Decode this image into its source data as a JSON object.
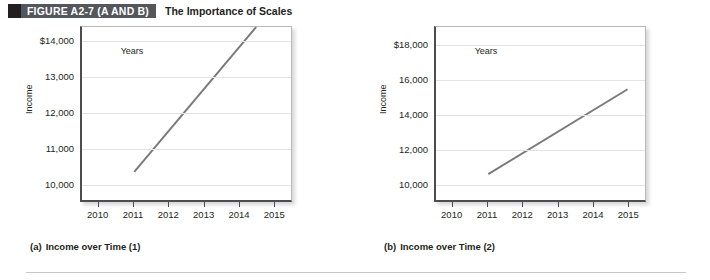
{
  "header": {
    "figure_tag": "FIGURE A2-7 (A AND B)",
    "title": "The Importance of Scales",
    "tag_bg": "#53565a",
    "tag_swatch": "#231f20"
  },
  "chart_data": [
    {
      "id": "a",
      "type": "line",
      "title": "Income over Time (1)",
      "caption_index": "(a)",
      "xlabel": "Years",
      "ylabel": "Income",
      "x": [
        2011,
        2014.5
      ],
      "values": [
        10300,
        14400
      ],
      "series": [
        {
          "name": "Income",
          "values": [
            10300,
            14400
          ]
        }
      ],
      "categories": [
        "2010",
        "2011",
        "2012",
        "2013",
        "2014",
        "2015"
      ],
      "xticklabels": [
        "2010",
        "2011",
        "2012",
        "2013",
        "2014",
        "2015"
      ],
      "yticklabels": [
        "10,000",
        "11,000",
        "12,000",
        "13,000",
        "$14,000"
      ],
      "ylim": [
        9500,
        14400
      ],
      "xlim": [
        2009.5,
        2015.5
      ],
      "grid": true,
      "legend": "none",
      "line_color": "#7a7a7a"
    },
    {
      "id": "b",
      "type": "line",
      "title": "Income over Time (2)",
      "caption_index": "(b)",
      "xlabel": "Years",
      "ylabel": "Income",
      "x": [
        2011,
        2015
      ],
      "values": [
        10500,
        15400
      ],
      "series": [
        {
          "name": "Income",
          "values": [
            10500,
            15400
          ]
        }
      ],
      "categories": [
        "2010",
        "2011",
        "2012",
        "2013",
        "2014",
        "2015"
      ],
      "xticklabels": [
        "2010",
        "2011",
        "2012",
        "2013",
        "2014",
        "2015"
      ],
      "yticklabels": [
        "10,000",
        "12,000",
        "14,000",
        "16,000",
        "$18,000"
      ],
      "ylim": [
        9000,
        19000
      ],
      "xlim": [
        2009.5,
        2015.5
      ],
      "grid": true,
      "legend": "none",
      "line_color": "#7a7a7a"
    }
  ]
}
